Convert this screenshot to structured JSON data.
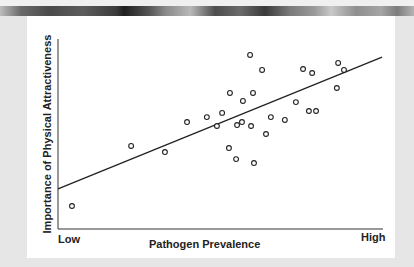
{
  "chart_data": {
    "type": "scatter",
    "title": "",
    "xlabel": "Pathogen Prevalence",
    "ylabel": "Importance of Physical Attractiveness",
    "x_tick_labels": {
      "low": "Low",
      "high": "High"
    },
    "xlim": [
      0,
      100
    ],
    "ylim": [
      0,
      100
    ],
    "grid": false,
    "legend": null,
    "units_note": "relative scale 0-100 (axes unlabeled numerically)",
    "series": [
      {
        "name": "countries",
        "marker": "open-circle",
        "points": [
          [
            4.3,
            12.1
          ],
          [
            22.5,
            43.7
          ],
          [
            32.9,
            40.5
          ],
          [
            39.7,
            56.3
          ],
          [
            45.8,
            58.9
          ],
          [
            48.9,
            54.2
          ],
          [
            50.5,
            61.1
          ],
          [
            52.9,
            71.6
          ],
          [
            52.6,
            42.6
          ],
          [
            54.8,
            36.8
          ],
          [
            55.1,
            54.7
          ],
          [
            56.6,
            56.3
          ],
          [
            56.9,
            67.4
          ],
          [
            59.1,
            91.6
          ],
          [
            59.4,
            54.2
          ],
          [
            60.0,
            71.6
          ],
          [
            60.3,
            34.7
          ],
          [
            62.8,
            83.7
          ],
          [
            64.0,
            50.0
          ],
          [
            65.5,
            58.9
          ],
          [
            69.8,
            57.4
          ],
          [
            73.2,
            66.8
          ],
          [
            75.4,
            84.2
          ],
          [
            77.2,
            62.1
          ],
          [
            78.2,
            82.1
          ],
          [
            79.4,
            62.1
          ],
          [
            85.8,
            74.2
          ],
          [
            86.2,
            87.4
          ],
          [
            88.0,
            83.7
          ]
        ]
      }
    ],
    "trend_line": {
      "x": [
        0,
        99.7
      ],
      "y": [
        21.1,
        90.5
      ]
    }
  },
  "axis": {
    "x_label": "Pathogen Prevalence",
    "y_label": "Importance of Physical Attractiveness",
    "x_low": "Low",
    "x_high": "High"
  },
  "colors": {
    "ink": "#222222",
    "card": "#ffffff",
    "background": "#e6e6e6"
  }
}
